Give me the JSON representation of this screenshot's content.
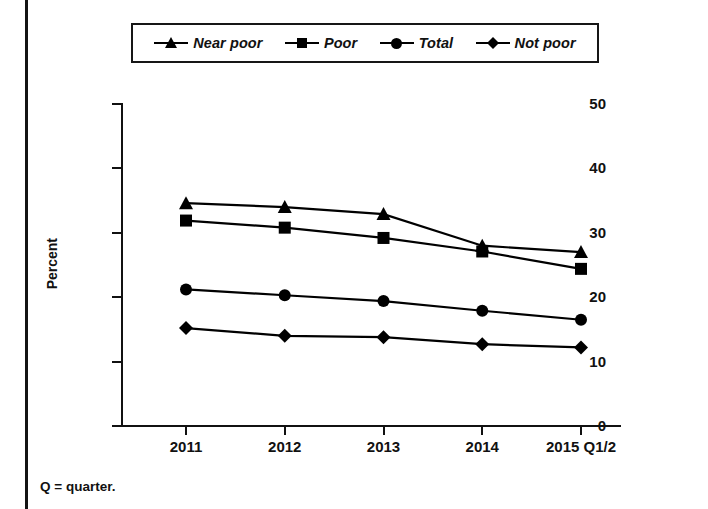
{
  "legend": {
    "items": [
      {
        "label": "Near poor",
        "marker": "triangle-marker"
      },
      {
        "label": "Poor",
        "marker": "square-marker"
      },
      {
        "label": "Total",
        "marker": "circle-marker"
      },
      {
        "label": "Not poor",
        "marker": "diamond-marker"
      }
    ]
  },
  "footnote": "Q = quarter.",
  "chart_data": {
    "type": "line",
    "title": "",
    "xlabel": "",
    "ylabel": "Percent",
    "categories": [
      "2011",
      "2012",
      "2013",
      "2014",
      "2015 Q1/2"
    ],
    "yticks": [
      0,
      10,
      20,
      30,
      40,
      50
    ],
    "ylim": [
      0,
      50
    ],
    "grid": false,
    "legend_position": "top",
    "series": [
      {
        "name": "Near poor",
        "marker": "triangle",
        "values": [
          34.6,
          34.0,
          32.9,
          28.0,
          27.0
        ]
      },
      {
        "name": "Poor",
        "marker": "square",
        "values": [
          31.9,
          30.8,
          29.2,
          27.1,
          24.4
        ]
      },
      {
        "name": "Total",
        "marker": "circle",
        "values": [
          21.2,
          20.3,
          19.4,
          17.9,
          16.5
        ]
      },
      {
        "name": "Not poor",
        "marker": "diamond",
        "values": [
          15.2,
          14.0,
          13.8,
          12.7,
          12.2
        ]
      }
    ]
  }
}
